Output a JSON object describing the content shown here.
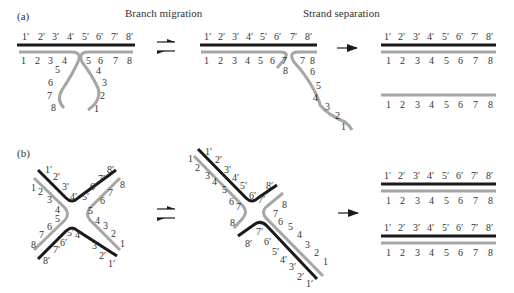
{
  "panels": {
    "a": {
      "label": "(a)",
      "step1_title": "Branch migration",
      "step2_title": "Strand separation",
      "arrow1": "⇌",
      "arrow2": "→"
    },
    "b": {
      "label": "(b)",
      "arrow1": "⇌",
      "arrow2": "→"
    }
  },
  "colors": {
    "dark_strand": "#1a1a1a",
    "light_strand": "#a6a6a6",
    "text": "#333333"
  },
  "prime_labels": [
    "1′",
    "2′",
    "3′",
    "4′",
    "5′",
    "6′",
    "7′",
    "8′"
  ],
  "plain_labels": [
    "1",
    "2",
    "3",
    "4",
    "5",
    "6",
    "7",
    "8"
  ]
}
